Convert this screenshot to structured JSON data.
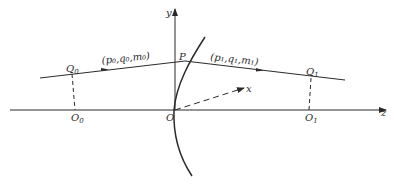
{
  "diagram": {
    "type": "optics ray through refracting surface",
    "axes": {
      "y_label": "y",
      "z_label": "z",
      "x_label": "x",
      "origin_label": "O"
    },
    "points": {
      "P": "P",
      "Q0": "Q",
      "Q0_sub": "0",
      "Q1": "Q",
      "Q1_sub": "1",
      "O0": "O",
      "O0_sub": "0",
      "O1": "O",
      "O1_sub": "1"
    },
    "ray_labels": {
      "incident": "(p₀,q₀,m₀)",
      "refracted": "(p₁,q₁,m₁)"
    },
    "colors": {
      "line": "#2a2a2a",
      "background": "#ffffff"
    }
  }
}
